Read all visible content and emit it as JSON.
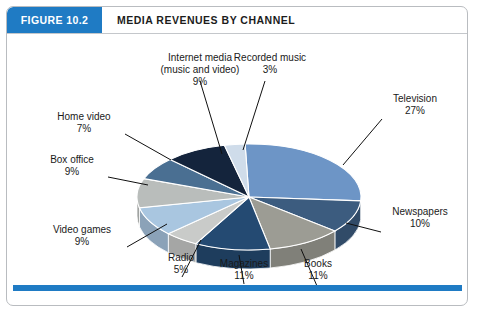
{
  "header": {
    "figure_tab": "FIGURE 10.2",
    "title": "MEDIA REVENUES BY CHANNEL",
    "tab_color": "#1f7bc4",
    "accent_color": "#1f7bc4"
  },
  "chart_data": {
    "type": "pie",
    "title": "MEDIA REVENUES BY CHANNEL",
    "subtitle": "",
    "xlabel": "",
    "ylabel": "",
    "legend_position": "callout-labels",
    "grid": false,
    "unit": "%",
    "categories": [
      "Television",
      "Newspapers",
      "Books",
      "Magazines",
      "Radio",
      "Video games",
      "Box office",
      "Home video",
      "Internet media (music and video)",
      "Recorded music"
    ],
    "values": [
      27,
      10,
      11,
      11,
      5,
      9,
      9,
      7,
      9,
      3
    ],
    "value_labels": [
      "27%",
      "10%",
      "11%",
      "11%",
      "5%",
      "9%",
      "9%",
      "9%",
      "9%",
      "3%"
    ],
    "colors": [
      "#6d95c6",
      "#3c5c7f",
      "#9c9c94",
      "#244a72",
      "#c9cbc9",
      "#a9c6e0",
      "#b9bdbb",
      "#4a6f92",
      "#14243c",
      "#cfdcea"
    ],
    "slices": [
      {
        "label": "Television",
        "value": 27,
        "value_label": "27%",
        "color": "#6d95c6"
      },
      {
        "label": "Newspapers",
        "value": 10,
        "value_label": "10%",
        "color": "#3c5c7f"
      },
      {
        "label": "Books",
        "value": 11,
        "value_label": "11%",
        "color": "#9c9c94"
      },
      {
        "label": "Magazines",
        "value": 11,
        "value_label": "11%",
        "color": "#244a72"
      },
      {
        "label": "Radio",
        "value": 5,
        "value_label": "5%",
        "color": "#c9cbc9"
      },
      {
        "label": "Video games",
        "value": 9,
        "value_label": "9%",
        "color": "#a9c6e0"
      },
      {
        "label": "Box office",
        "value": 9,
        "value_label": "9%",
        "color": "#b9bdbb"
      },
      {
        "label": "Home video",
        "value": 7,
        "value_label": "7%",
        "color": "#4a6f92"
      },
      {
        "label": "Internet media (music and video)",
        "value": 9,
        "value_label": "9%",
        "color": "#14243c"
      },
      {
        "label": "Recorded music",
        "value": 3,
        "value_label": "3%",
        "color": "#cfdcea"
      }
    ]
  },
  "labels": {
    "internet_media_line1": "Internet media",
    "internet_media_line2": "(music and video)",
    "internet_media_value": "9%",
    "recorded_music_name": "Recorded music",
    "recorded_music_value": "3%",
    "television_name": "Television",
    "television_value": "27%",
    "newspapers_name": "Newspapers",
    "newspapers_value": "10%",
    "books_name": "Books",
    "books_value": "11%",
    "magazines_name": "Magazines",
    "magazines_value": "11%",
    "radio_name": "Radio",
    "radio_value": "5%",
    "video_games_name": "Video games",
    "video_games_value": "9%",
    "box_office_name": "Box office",
    "box_office_value": "9%",
    "home_video_name": "Home video",
    "home_video_value": "7%"
  }
}
